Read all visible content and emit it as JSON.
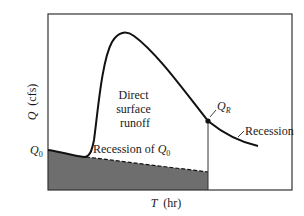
{
  "figure": {
    "type": "hydrograph",
    "y_axis_label": "Q (cfs)",
    "y_axis_var": "Q",
    "y_axis_unit": "(cfs)",
    "x_axis_label": "T (hr)",
    "x_axis_var": "T",
    "x_axis_unit": "(hr)",
    "labels": {
      "q0": "Q",
      "q0_sub": "0",
      "qr": "Q",
      "qr_sub": "R",
      "direct_line1": "Direct",
      "direct_line2": "surface",
      "direct_line3": "runoff",
      "recession": "Recession",
      "recession_of": "Recession of ",
      "recession_of_q": "Q",
      "recession_of_sub": "0"
    },
    "colors": {
      "baseflow_fill": "#6e6e6e",
      "curve": "#111111",
      "frame": "#333333"
    }
  }
}
